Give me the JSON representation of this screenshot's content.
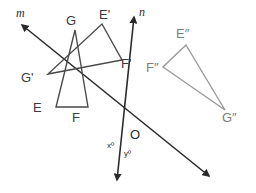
{
  "figure": {
    "background_color": "#ffffff"
  },
  "colors": {
    "line_dark": "#2b2b2b",
    "triangle_original": "#4a4a4a",
    "triangle_image1": "#4a4a4a",
    "triangle_image2": "#9a9a9a",
    "label_dark": "#2b2b2b",
    "label_light": "#7d7d7d"
  },
  "lines": [
    {
      "name": "line-m",
      "label": "m",
      "label_x": 16,
      "label_y": 17,
      "x1": 22,
      "y1": 25,
      "x2": 209,
      "y2": 176,
      "arrow_start": true,
      "arrow_end": true
    },
    {
      "name": "line-n",
      "label": "n",
      "label_x": 139,
      "label_y": 16,
      "x1": 134,
      "y1": 17,
      "x2": 117,
      "y2": 180,
      "arrow_start": true,
      "arrow_end": true
    }
  ],
  "triangles": [
    {
      "name": "triangle-efg",
      "stroke": "#4a4a4a",
      "vertices": [
        {
          "name": "vertex-e",
          "label": "E",
          "x": 56,
          "y": 107,
          "label_x": 33,
          "label_y": 112,
          "label_class": "vertex-label"
        },
        {
          "name": "vertex-f",
          "label": "F",
          "x": 88,
          "y": 107,
          "label_x": 72,
          "label_y": 122,
          "label_class": "vertex-label"
        },
        {
          "name": "vertex-g",
          "label": "G",
          "x": 75,
          "y": 30,
          "label_x": 66,
          "label_y": 25,
          "label_class": "vertex-label"
        }
      ]
    },
    {
      "name": "triangle-e1f1g1",
      "stroke": "#4a4a4a",
      "vertices": [
        {
          "name": "vertex-e-prime",
          "label": "E'",
          "x": 102,
          "y": 24,
          "label_x": 99,
          "label_y": 19,
          "label_class": "vertex-label"
        },
        {
          "name": "vertex-f-prime",
          "label": "F'",
          "x": 122,
          "y": 60,
          "label_x": 121,
          "label_y": 68,
          "label_class": "vertex-label"
        },
        {
          "name": "vertex-g-prime",
          "label": "G'",
          "x": 48,
          "y": 74,
          "label_x": 21,
          "label_y": 82,
          "label_class": "vertex-label"
        }
      ]
    },
    {
      "name": "triangle-e2f2g2",
      "stroke": "#9a9a9a",
      "vertices": [
        {
          "name": "vertex-e-dprime",
          "label": "E″",
          "x": 186,
          "y": 45,
          "label_x": 176,
          "label_y": 38,
          "label_class": "vertex-label-light"
        },
        {
          "name": "vertex-f-dprime",
          "label": "F″",
          "x": 163,
          "y": 67,
          "label_x": 146,
          "label_y": 72,
          "label_class": "vertex-label-light"
        },
        {
          "name": "vertex-g-dprime",
          "label": "G″",
          "x": 225,
          "y": 110,
          "label_x": 222,
          "label_y": 122,
          "label_class": "vertex-label-light"
        }
      ]
    }
  ],
  "points": [
    {
      "name": "point-o",
      "label": "O",
      "x": 127,
      "y": 133,
      "label_x": 130,
      "label_y": 139
    }
  ],
  "angles": [
    {
      "name": "angle-x",
      "label": "xº",
      "x": 107,
      "y": 148
    },
    {
      "name": "angle-y",
      "label": "yº",
      "x": 124,
      "y": 156
    }
  ]
}
